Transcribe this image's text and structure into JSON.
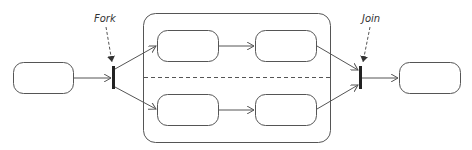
{
  "diagram": {
    "type": "UML activity diagram (fork/join)",
    "labels": {
      "fork": "Fork",
      "join": "Join"
    },
    "colors": {
      "stroke": "#555555",
      "bar": "#222222",
      "background": "#ffffff"
    },
    "nodes": [
      {
        "id": "start-state",
        "x": 13,
        "y": 62,
        "w": 60,
        "h": 31
      },
      {
        "id": "top-left-state",
        "x": 157,
        "y": 30,
        "w": 61,
        "h": 31
      },
      {
        "id": "top-right-state",
        "x": 255,
        "y": 30,
        "w": 61,
        "h": 31
      },
      {
        "id": "bottom-left-state",
        "x": 157,
        "y": 94,
        "w": 61,
        "h": 31
      },
      {
        "id": "bottom-right-state",
        "x": 255,
        "y": 94,
        "w": 61,
        "h": 31
      },
      {
        "id": "end-state",
        "x": 399,
        "y": 62,
        "w": 61,
        "h": 31
      }
    ],
    "container": {
      "x": 143,
      "y": 13,
      "w": 187,
      "h": 129
    },
    "fork_bar": {
      "x": 112,
      "y": 66,
      "w": 3,
      "h": 23
    },
    "join_bar": {
      "x": 359,
      "y": 66,
      "w": 3,
      "h": 23
    }
  }
}
